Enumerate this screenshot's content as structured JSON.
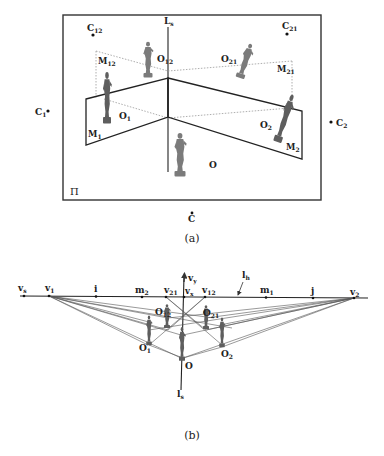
{
  "figure_a": {
    "caption": "(a)",
    "plane_label": "Π",
    "axis_label": {
      "main": "L",
      "sub": "s"
    },
    "camera_labels": [
      {
        "id": "C12",
        "main": "C",
        "sub": "12"
      },
      {
        "id": "C21",
        "main": "C",
        "sub": "21"
      },
      {
        "id": "C1",
        "main": "C",
        "sub": "1"
      },
      {
        "id": "C2",
        "main": "C",
        "sub": "2"
      },
      {
        "id": "C",
        "main": "C",
        "sub": ""
      }
    ],
    "mirror_labels": [
      {
        "id": "M12",
        "main": "M",
        "sub": "12"
      },
      {
        "id": "M21",
        "main": "M",
        "sub": "21"
      },
      {
        "id": "M1",
        "main": "M",
        "sub": "1"
      },
      {
        "id": "M2",
        "main": "M",
        "sub": "2"
      }
    ],
    "object_labels": [
      {
        "id": "O12",
        "main": "O",
        "sub": "12"
      },
      {
        "id": "O21",
        "main": "O",
        "sub": "21"
      },
      {
        "id": "O1",
        "main": "O",
        "sub": "1"
      },
      {
        "id": "O2",
        "main": "O",
        "sub": "2"
      },
      {
        "id": "O",
        "main": "O",
        "sub": ""
      }
    ]
  },
  "figure_b": {
    "caption": "(b)",
    "horizon_label": {
      "main": "l",
      "sub": "h"
    },
    "axis_label": {
      "main": "l",
      "sub": "s"
    },
    "vertical_vp_label": {
      "main": "v",
      "sub": "y"
    },
    "horizon_points": [
      {
        "id": "vs",
        "main": "v",
        "sub": "s"
      },
      {
        "id": "v1",
        "main": "v",
        "sub": "1"
      },
      {
        "id": "i",
        "main": "i",
        "sub": ""
      },
      {
        "id": "m2",
        "main": "m",
        "sub": "2"
      },
      {
        "id": "v21",
        "main": "v",
        "sub": "21"
      },
      {
        "id": "vx",
        "main": "v",
        "sub": "x"
      },
      {
        "id": "v12",
        "main": "v",
        "sub": "12"
      },
      {
        "id": "m1",
        "main": "m",
        "sub": "1"
      },
      {
        "id": "j",
        "main": "j",
        "sub": ""
      },
      {
        "id": "v2",
        "main": "v",
        "sub": "2"
      }
    ],
    "object_labels": [
      {
        "id": "O12",
        "main": "O",
        "sub": "12"
      },
      {
        "id": "O21",
        "main": "O",
        "sub": "21"
      },
      {
        "id": "O1",
        "main": "O",
        "sub": "1"
      },
      {
        "id": "O2",
        "main": "O",
        "sub": "2"
      },
      {
        "id": "O",
        "main": "O",
        "sub": ""
      }
    ]
  }
}
